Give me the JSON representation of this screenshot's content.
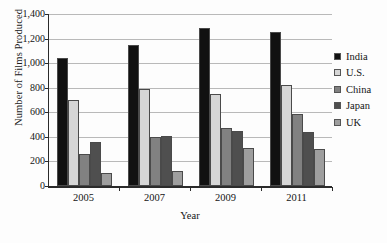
{
  "chart_data": {
    "type": "bar",
    "title": "",
    "xlabel": "Year",
    "ylabel": "Number of Films Produced",
    "categories": [
      "2005",
      "2007",
      "2009",
      "2011"
    ],
    "ylim": [
      0,
      1400
    ],
    "yticks": [
      0,
      200,
      400,
      600,
      800,
      1000,
      1200,
      1400
    ],
    "ytick_labels": [
      "0",
      "200",
      "400",
      "600",
      "800",
      "1,000",
      "1,200",
      "1,400"
    ],
    "grid": true,
    "legend_position": "right",
    "series": [
      {
        "name": "India",
        "color": "#111111",
        "values": [
          1040,
          1146,
          1285,
          1255
        ]
      },
      {
        "name": "U.S.",
        "color": "#d6d6d6",
        "values": [
          699,
          793,
          745,
          825
        ]
      },
      {
        "name": "China",
        "color": "#818181",
        "values": [
          261,
          402,
          470,
          588
        ]
      },
      {
        "name": "Japan",
        "color": "#4f4f4f",
        "values": [
          356,
          407,
          448,
          441
        ]
      },
      {
        "name": "UK",
        "color": "#9e9e9e",
        "values": [
          110,
          125,
          310,
          299
        ]
      }
    ]
  }
}
